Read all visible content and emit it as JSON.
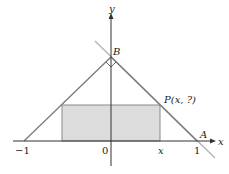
{
  "diagram": {
    "axes": {
      "x_label": "x",
      "y_label": "y",
      "origin_label": "0",
      "tick_neg1": "−1",
      "tick_pos1": "1",
      "tick_x": "x"
    },
    "points": {
      "B": "B",
      "A": "A",
      "P": "P(x, ?)"
    },
    "colors": {
      "line": "#7a7a7a",
      "axis": "#333333",
      "rect_fill": "#dcdcdc",
      "rect_stroke": "#8a8a8a",
      "extension": "#aaaaaa"
    }
  }
}
